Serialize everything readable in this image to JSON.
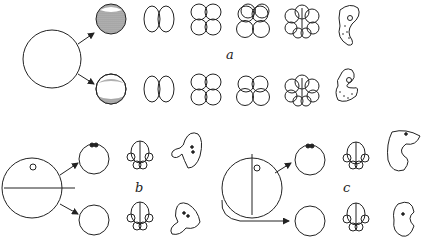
{
  "figure": {
    "panels": [
      {
        "id": "a",
        "label": "a",
        "description": "Uncut egg gives rise to two rows of normal cleavage: 2-cell, 4-cell, 8-cell, 16-cell, and embryo"
      },
      {
        "id": "b",
        "label": "b",
        "description": "Egg cut along horizontal plane; both halves develop"
      },
      {
        "id": "c",
        "label": "c",
        "description": "Egg cut along vertical plane; both halves develop"
      }
    ],
    "colors": {
      "stroke": "#222222",
      "shading": "#9a9a9a",
      "background": "#ffffff"
    }
  }
}
